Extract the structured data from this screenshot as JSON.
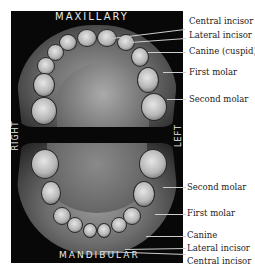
{
  "figure": {
    "upper_jaw_label": "MAXILLARY",
    "lower_jaw_label": "MANDIBULAR",
    "right_label": "RIGHT",
    "left_label": "LEFT"
  },
  "upper_callouts": [
    {
      "label": "Central incisor"
    },
    {
      "label": "Lateral incisor"
    },
    {
      "label": "Canine (cuspid)"
    },
    {
      "label": "First molar"
    },
    {
      "label": "Second molar"
    }
  ],
  "lower_callouts": [
    {
      "label": "Second molar"
    },
    {
      "label": "First molar"
    },
    {
      "label": "Canine"
    },
    {
      "label": "Lateral incisor"
    },
    {
      "label": "Central incisor"
    }
  ]
}
